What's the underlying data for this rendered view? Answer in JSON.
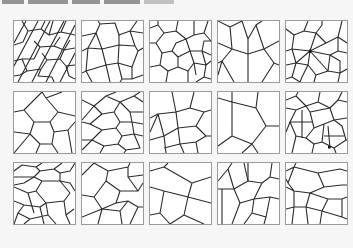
{
  "header": {
    "text_visible": false,
    "note": ""
  },
  "figure": {
    "layout": {
      "rows": 3,
      "columns": 5
    },
    "tiles": [
      {
        "row": 1,
        "col": 1,
        "pattern": "elongated-diagonal-cells"
      },
      {
        "row": 1,
        "col": 2,
        "pattern": "large-irregular-polygons"
      },
      {
        "row": 1,
        "col": 3,
        "pattern": "medium-polygons-clustered"
      },
      {
        "row": 1,
        "col": 4,
        "pattern": "four-large-cells-cross"
      },
      {
        "row": 1,
        "col": 5,
        "pattern": "radial-star-polygons"
      },
      {
        "row": 2,
        "col": 1,
        "pattern": "few-large-polygons"
      },
      {
        "row": 2,
        "col": 2,
        "pattern": "chevron-rows"
      },
      {
        "row": 2,
        "col": 3,
        "pattern": "irregular-medium-cells"
      },
      {
        "row": 2,
        "col": 4,
        "pattern": "very-large-cells"
      },
      {
        "row": 2,
        "col": 5,
        "pattern": "polygons-with-cross-subdivisions"
      },
      {
        "row": 3,
        "col": 1,
        "pattern": "dense-hexagonal-shards"
      },
      {
        "row": 3,
        "col": 2,
        "pattern": "arrow-like-polygons"
      },
      {
        "row": 3,
        "col": 3,
        "pattern": "sparse-large-cells"
      },
      {
        "row": 3,
        "col": 4,
        "pattern": "vertical-elongated-cells"
      },
      {
        "row": 3,
        "col": 5,
        "pattern": "horizontal-band-cells"
      }
    ],
    "colors": {
      "background": "#f6f6f6",
      "tile_fill": "#ffffff",
      "tile_border": "#9a9a9a",
      "edge": "#2a2a2a"
    }
  }
}
